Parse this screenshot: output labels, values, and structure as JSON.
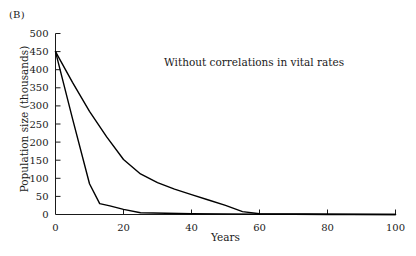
{
  "panel": {
    "label": "(B)"
  },
  "annotation": {
    "text": "Without correlations in vital rates"
  },
  "axis_titles": {
    "x": "Years",
    "y": "Population size (thousands)"
  },
  "chart_data": {
    "type": "line",
    "title": "",
    "subtitle": "",
    "annotations": [
      "Without correlations in vital rates",
      "(B)"
    ],
    "xlabel": "Years",
    "ylabel": "Population size (thousands)",
    "xlim": [
      0,
      100
    ],
    "ylim": [
      0,
      500
    ],
    "xticks": [
      0,
      20,
      40,
      60,
      80,
      100
    ],
    "yticks": [
      0,
      50,
      100,
      150,
      200,
      250,
      300,
      350,
      400,
      450,
      500
    ],
    "xtick_labels": [
      "0",
      "20",
      "40",
      "60",
      "80",
      "100"
    ],
    "ytick_labels": [
      "0",
      "50",
      "100",
      "150",
      "200",
      "250",
      "300",
      "350",
      "400",
      "450",
      "500"
    ],
    "grid": false,
    "legend": false,
    "legend_position": "none",
    "line_color": "#000000",
    "series": [
      {
        "name": "slow-decline",
        "x": [
          0,
          5,
          10,
          15,
          20,
          25,
          30,
          35,
          40,
          45,
          50,
          55,
          60,
          100
        ],
        "values": [
          450,
          365,
          285,
          215,
          152,
          112,
          88,
          70,
          55,
          40,
          25,
          8,
          2,
          0
        ]
      },
      {
        "name": "rapid-decline",
        "x": [
          0,
          5,
          10,
          13,
          16,
          20,
          25,
          40,
          60,
          80,
          100
        ],
        "values": [
          450,
          265,
          85,
          30,
          24,
          14,
          5,
          2,
          1,
          0,
          0
        ]
      }
    ]
  }
}
